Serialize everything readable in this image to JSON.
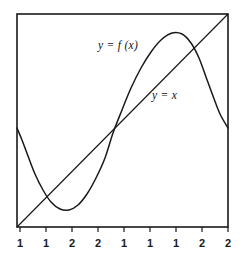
{
  "figure": {
    "title": "",
    "background_color": "#ffffff",
    "stroke_color": "#1a1a1a",
    "frame": {
      "x0": 17,
      "y0": 14,
      "x1": 228,
      "y1": 227
    }
  },
  "labels": {
    "function_curve": {
      "text": "y = f (x)",
      "y": "y",
      "eq": "=",
      "fx": "f (x)",
      "x": 98,
      "y_pos": 39
    },
    "identity_line": {
      "text": "y = x",
      "y": "y",
      "eq": "=",
      "x_sym": "x",
      "x": 152,
      "y_pos": 89
    }
  },
  "axis": {
    "tick_labels": [
      "1",
      "1",
      "2",
      "2",
      "1",
      "1",
      "1",
      "2",
      "2"
    ],
    "tick_x_positions": [
      20,
      46,
      72,
      98,
      124,
      150,
      176,
      202,
      228
    ],
    "tick_length": 5,
    "axis_y": 227
  },
  "chart_data": {
    "type": "line",
    "title": "",
    "xlabel": "",
    "ylabel": "",
    "grid": false,
    "legend": "inline-annotations",
    "xlim": [
      0,
      9
    ],
    "ylim": [
      0,
      9
    ],
    "series": [
      {
        "name": "y = f (x)",
        "style": "solid-curve",
        "points_px": [
          [
            17,
            128
          ],
          [
            22,
            140
          ],
          [
            28,
            156
          ],
          [
            35,
            174
          ],
          [
            43,
            190
          ],
          [
            51,
            202
          ],
          [
            60,
            209
          ],
          [
            69,
            210
          ],
          [
            78,
            205
          ],
          [
            87,
            194
          ],
          [
            96,
            178
          ],
          [
            105,
            158
          ],
          [
            113,
            133
          ],
          [
            122,
            110
          ],
          [
            131,
            88
          ],
          [
            141,
            68
          ],
          [
            151,
            52
          ],
          [
            161,
            40
          ],
          [
            172,
            33
          ],
          [
            182,
            34
          ],
          [
            191,
            43
          ],
          [
            199,
            58
          ],
          [
            206,
            77
          ],
          [
            213,
            96
          ],
          [
            220,
            114
          ],
          [
            228,
            128
          ]
        ]
      },
      {
        "name": "y = x",
        "style": "solid-straight",
        "points_px": [
          [
            17,
            227
          ],
          [
            228,
            14
          ]
        ]
      }
    ],
    "intersections_px": [
      [
        113,
        133
      ],
      [
        203,
        46
      ]
    ]
  }
}
